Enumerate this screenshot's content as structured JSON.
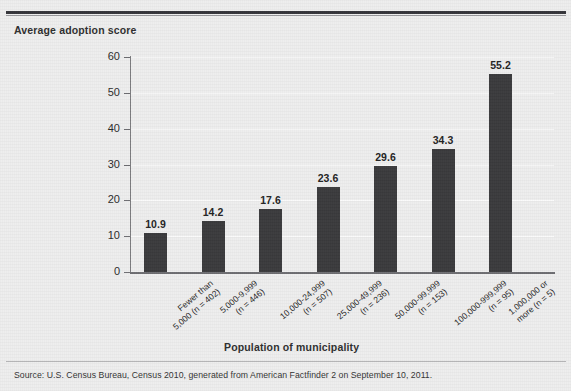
{
  "figure": {
    "cropped_title_fragment": "",
    "source_note": "Source: U.S. Census Bureau, Census 2010, generated from American Factfinder 2 on September 10, 2011."
  },
  "chart_data": {
    "type": "bar",
    "title": "",
    "xlabel": "Population of municipality",
    "ylabel": "Average adoption score",
    "categories": [
      "Fewer than 5,000 (n = 402)",
      "5,000-9,999 (n = 446)",
      "10,000-24,999 (n = 507)",
      "25,000-49,999 (n = 236)",
      "50,000-99,999 (n = 153)",
      "100,000-999,999 (n = 95)",
      "1,000,000 or more (n = 5)"
    ],
    "category_lines": [
      [
        "Fewer than",
        "5,000 (n = 402)"
      ],
      [
        "5,000-9,999",
        "(n = 446)"
      ],
      [
        "10,000-24,999",
        "(n = 507)"
      ],
      [
        "25,000-49,999",
        "(n = 236)"
      ],
      [
        "50,000-99,999",
        "(n = 153)"
      ],
      [
        "100,000-999,999",
        "(n = 95)"
      ],
      [
        "1,000,000 or",
        "more (n = 5)"
      ]
    ],
    "sample_sizes": [
      402,
      446,
      507,
      236,
      153,
      95,
      5
    ],
    "values": [
      10.9,
      14.2,
      17.6,
      23.6,
      29.6,
      34.3,
      55.2
    ],
    "value_labels": [
      "10.9",
      "14.2",
      "17.6",
      "23.6",
      "29.6",
      "34.3",
      "55.2"
    ],
    "ylim": [
      0,
      60
    ],
    "ytick_labels": [
      "0",
      "10",
      "20",
      "30",
      "40",
      "50",
      "60"
    ],
    "yticks": [
      0,
      10,
      20,
      30,
      40,
      50,
      60
    ],
    "grid": true,
    "legend": null,
    "bar_color": "#3a3a3c",
    "background_color": "#eeeeee"
  }
}
